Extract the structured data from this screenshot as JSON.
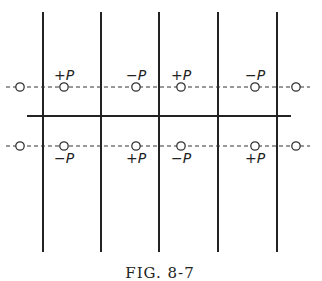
{
  "figure": {
    "caption": "FIG. 8-7",
    "vertical_lines_x": [
      43,
      101,
      159,
      218,
      277
    ],
    "vertical_top": 12,
    "vertical_bottom": 252,
    "solid_line": {
      "y": 116,
      "x1": 27,
      "x2": 291
    },
    "upper_row": {
      "y": 87,
      "nodes": [
        {
          "x": 20,
          "label": ""
        },
        {
          "x": 64,
          "label": "+P"
        },
        {
          "x": 136,
          "label": "−P"
        },
        {
          "x": 181,
          "label": "+P"
        },
        {
          "x": 255,
          "label": "−P"
        },
        {
          "x": 296,
          "label": ""
        }
      ]
    },
    "lower_row": {
      "y": 146,
      "nodes": [
        {
          "x": 20,
          "label": ""
        },
        {
          "x": 64,
          "label": "−P"
        },
        {
          "x": 136,
          "label": "+P"
        },
        {
          "x": 181,
          "label": "−P"
        },
        {
          "x": 255,
          "label": "+P"
        },
        {
          "x": 296,
          "label": ""
        }
      ]
    }
  }
}
